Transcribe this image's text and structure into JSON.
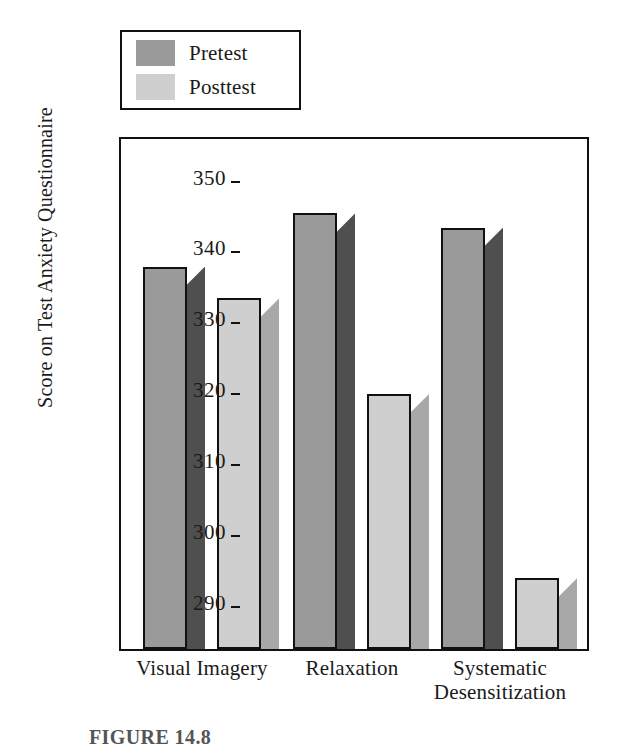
{
  "figure": {
    "caption": "FIGURE 14.8"
  },
  "legend": {
    "position": "above-plot",
    "entries": [
      {
        "label": "Pretest",
        "front_color": "#9a9a9a",
        "side_color": "#4f4f4f"
      },
      {
        "label": "Posttest",
        "front_color": "#cfcfcf",
        "side_color": "#a8a8a8"
      }
    ]
  },
  "chart_data": {
    "type": "bar",
    "title": "",
    "subtitle": "",
    "xlabel": "",
    "ylabel": "Score on Test Anxiety Questionnaire",
    "categories": [
      "Visual Imagery",
      "Relaxation",
      "Systematic Desensitization"
    ],
    "series": [
      {
        "name": "Pretest",
        "values": [
          338,
          345.5,
          343.5
        ]
      },
      {
        "name": "Posttest",
        "values": [
          333.5,
          320,
          294
        ]
      }
    ],
    "ylim": [
      284,
      356
    ],
    "yticks": [
      290,
      300,
      310,
      320,
      330,
      340,
      350
    ],
    "ytick_labels": [
      "290",
      "300",
      "310",
      "320",
      "330",
      "340",
      "350"
    ],
    "grid": false,
    "legend_position": "top-left-above-axes",
    "bar_style": "3d-extruded",
    "annotations": []
  }
}
